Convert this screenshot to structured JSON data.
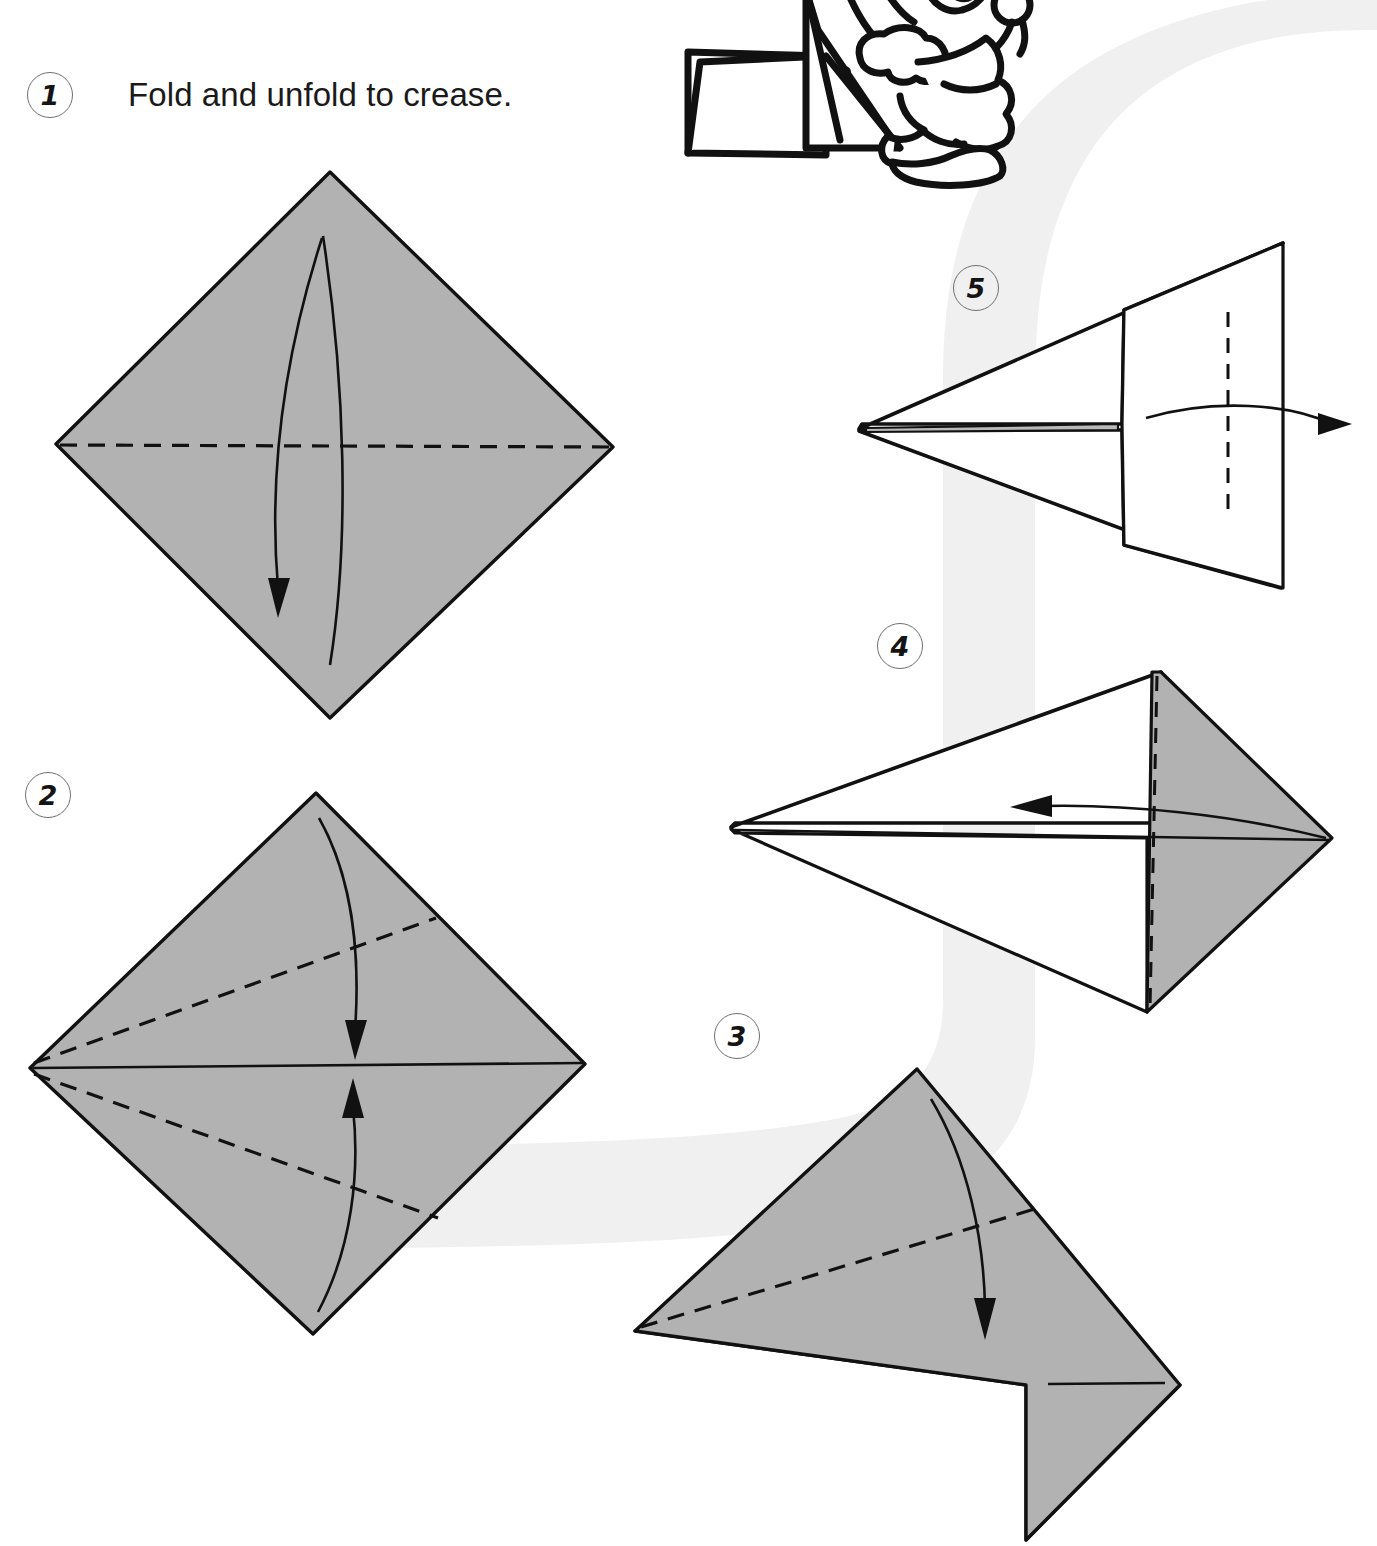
{
  "page": {
    "width": 1377,
    "height": 1546,
    "background_color": "#ffffff",
    "paper_gray": "#b2b2b2",
    "paper_white": "#ffffff",
    "line_color": "#111111",
    "swoosh_color": "#f0f0f0"
  },
  "steps": [
    {
      "number": "1",
      "caption": "Fold and unfold to crease.",
      "diagram": "gray-diamond-with-horizontal-crease",
      "creases": [
        "horizontal valley crease"
      ],
      "arrows": [
        "fold-down-and-unfold arrow"
      ]
    },
    {
      "number": "2",
      "caption": "",
      "diagram": "gray-diamond-with-two-diagonal-creases",
      "creases": [
        "upper diagonal to center line",
        "lower diagonal to center line"
      ],
      "arrows": [
        "fold top edge down arrow",
        "fold bottom edge up arrow"
      ]
    },
    {
      "number": "3",
      "caption": "",
      "diagram": "kite-with-white-flap-and-dashed-fold",
      "creases": [
        "diagonal dashed fold"
      ],
      "arrows": [
        "fold down arrow"
      ]
    },
    {
      "number": "4",
      "caption": "",
      "diagram": "dart-with-gray-right-panel-and-vertical-dashed-fold",
      "creases": [
        "vertical dashed fold"
      ],
      "arrows": [
        "fold left arrow"
      ]
    },
    {
      "number": "5",
      "caption": "",
      "diagram": "white-dart-with-vertical-dashed-fold",
      "creases": [
        "vertical dashed fold"
      ],
      "arrows": [
        "fold right arrow"
      ]
    }
  ],
  "illustration": {
    "name": "cartoon-character-with-folded-paper",
    "description": "Line-art cartoon of a figure holding a folded paper model, cropped at the top edge of the page"
  }
}
